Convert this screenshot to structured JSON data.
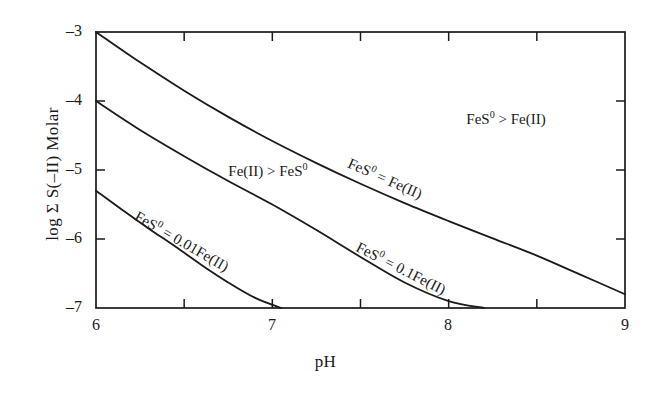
{
  "chart_data": {
    "type": "line",
    "title": "",
    "xlabel": "pH",
    "ylabel": "log Σ S(−II)  Molar",
    "xlim": [
      6,
      9
    ],
    "ylim": [
      -7,
      -3
    ],
    "grid": false,
    "legend": "none",
    "xticks": [
      6,
      7,
      8,
      9
    ],
    "xtick_labels": [
      "6",
      "7",
      "8",
      "9"
    ],
    "xminor_ticks": [
      6.5,
      7.5,
      8.5
    ],
    "yticks": [
      -3,
      -4,
      -5,
      -6,
      -7
    ],
    "ytick_labels": [
      "–3",
      "–4",
      "–5",
      "–6",
      "–7"
    ],
    "yminor_ticks": [],
    "series": [
      {
        "name": "FeS0 = Fe(II)",
        "x": [
          6.0,
          6.25,
          6.5,
          6.75,
          7.0,
          7.25,
          7.5,
          7.75,
          8.0,
          8.25,
          8.5,
          8.75,
          9.0
        ],
        "y": [
          -3.0,
          -3.44,
          -3.85,
          -4.23,
          -4.58,
          -4.9,
          -5.2,
          -5.48,
          -5.74,
          -5.99,
          -6.24,
          -6.52,
          -6.8
        ]
      },
      {
        "name": "FeS0 = 0.1Fe(II)",
        "x": [
          6.0,
          6.25,
          6.5,
          6.75,
          7.0,
          7.25,
          7.5,
          7.75,
          8.0,
          8.2
        ],
        "y": [
          -4.0,
          -4.42,
          -4.8,
          -5.16,
          -5.5,
          -5.87,
          -6.26,
          -6.63,
          -6.9,
          -7.0
        ]
      },
      {
        "name": "FeS0 = 0.01Fe(II)",
        "x": [
          6.0,
          6.15,
          6.3,
          6.45,
          6.6,
          6.75,
          6.9,
          7.05
        ],
        "y": [
          -5.3,
          -5.58,
          -5.85,
          -6.11,
          -6.38,
          -6.63,
          -6.85,
          -7.0
        ]
      }
    ],
    "annotations": [
      {
        "id": "region-upper-right",
        "text": "FeS⁰ > Fe(II)",
        "x": 8.1,
        "y": -4.15,
        "rotation": 0
      },
      {
        "id": "region-left",
        "text": "Fe(II) > FeS⁰",
        "x": 6.75,
        "y": -4.9,
        "rotation": 0
      },
      {
        "id": "curve-1-label",
        "text": "FeS⁰ = Fe(II)",
        "x": 7.45,
        "y": -4.78,
        "rotation": 24
      },
      {
        "id": "curve-2-label",
        "text": "FeS⁰ = 0.1Fe(II)",
        "x": 7.5,
        "y": -6.0,
        "rotation": 27
      },
      {
        "id": "curve-3-label",
        "text": "FeS⁰ = 0.01Fe(II)",
        "x": 6.25,
        "y": -5.55,
        "rotation": 30
      }
    ]
  },
  "axes": {
    "xlabel": "pH",
    "ylabel_prefix": "log Σ S(",
    "ylabel": "log Σ S(–II)  Molar"
  },
  "colors": {
    "background": "#ffffff",
    "line": "#1a1a1a",
    "frame": "#1a1a1a",
    "text": "#1a1a1a"
  },
  "labels": {
    "region_upper_right": "FeS⁰ > Fe(II)",
    "region_left": "Fe(II) > FeS⁰",
    "curve_1": "FeS⁰ = Fe(II)",
    "curve_2": "FeS⁰ = 0.1Fe(II)",
    "curve_3": "FeS⁰ = 0.01Fe(II)",
    "ytick_m3": "–3",
    "ytick_m4": "–4",
    "ytick_m5": "–5",
    "ytick_m6": "–6",
    "ytick_m7": "–7",
    "xtick_6": "6",
    "xtick_7": "7",
    "xtick_8": "8",
    "xtick_9": "9"
  }
}
